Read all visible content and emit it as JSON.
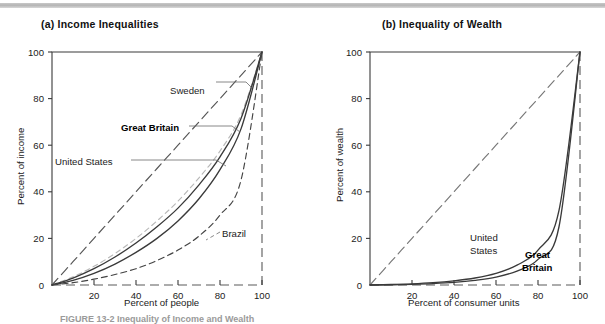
{
  "figure": {
    "top_rule_color": "#b9b9b9",
    "caption": "FIGURE 13-2   Inequality of Income and Wealth"
  },
  "panels": [
    {
      "key": "a",
      "title": "(a) Income Inequalities",
      "xlabel": "Percent of people",
      "ylabel": "Percent of income",
      "xticks": [
        "20",
        "40",
        "60",
        "80",
        "100"
      ],
      "yticks": [
        "0",
        "20",
        "40",
        "60",
        "80",
        "100"
      ],
      "labels": [
        {
          "text": "Sweden",
          "bold": false
        },
        {
          "text": "Great Britain",
          "bold": true
        },
        {
          "text": "United States",
          "bold": false
        },
        {
          "text": "Brazil",
          "bold": false
        }
      ]
    },
    {
      "key": "b",
      "title": "(b) Inequality of Wealth",
      "xlabel": "Percent of consumer units",
      "ylabel": "Percent of wealth",
      "xticks": [
        "20",
        "40",
        "60",
        "80",
        "100"
      ],
      "yticks": [
        "0",
        "20",
        "40",
        "60",
        "80",
        "100"
      ],
      "labels": [
        {
          "text": "United",
          "bold": false
        },
        {
          "text": "States",
          "bold": false
        },
        {
          "text": "Great",
          "bold": true
        },
        {
          "text": "Britain",
          "bold": true
        }
      ]
    }
  ],
  "chart_data": [
    {
      "type": "line",
      "title": "(a) Income Inequalities",
      "xlabel": "Percent of people",
      "ylabel": "Percent of income",
      "xlim": [
        0,
        100
      ],
      "ylim": [
        0,
        100
      ],
      "xticks": [
        20,
        40,
        60,
        80,
        100
      ],
      "yticks": [
        0,
        20,
        40,
        60,
        80,
        100
      ],
      "grid": false,
      "legend": "inline-annotations",
      "x": [
        0,
        10,
        20,
        30,
        40,
        50,
        60,
        70,
        80,
        90,
        100
      ],
      "series": [
        {
          "name": "Line of equality",
          "style": "long-dash",
          "color": "#555555",
          "values": [
            0,
            10,
            20,
            30,
            40,
            50,
            60,
            70,
            80,
            90,
            100
          ]
        },
        {
          "name": "Sweden",
          "style": "short-dash-light",
          "color": "#b8b8b8",
          "values": [
            0,
            3.5,
            8,
            13.5,
            20,
            27.5,
            36,
            46,
            57.5,
            73,
            100
          ]
        },
        {
          "name": "Great Britain",
          "style": "solid",
          "color": "#3a3a3a",
          "values": [
            0,
            3,
            7,
            12,
            18,
            25,
            33,
            43,
            55,
            71.5,
            100
          ]
        },
        {
          "name": "United States",
          "style": "solid",
          "color": "#3a3a3a",
          "values": [
            0,
            2,
            5,
            9,
            14,
            20,
            27.5,
            37,
            49.5,
            67,
            100
          ]
        },
        {
          "name": "Brazil",
          "style": "dash",
          "color": "#444444",
          "values": [
            0,
            1,
            2.5,
            4.5,
            7,
            10.5,
            15,
            21,
            30,
            45,
            100
          ]
        }
      ]
    },
    {
      "type": "line",
      "title": "(b) Inequality of Wealth",
      "xlabel": "Percent of consumer units",
      "ylabel": "Percent of wealth",
      "xlim": [
        0,
        100
      ],
      "ylim": [
        0,
        100
      ],
      "xticks": [
        20,
        40,
        60,
        80,
        100
      ],
      "yticks": [
        0,
        20,
        40,
        60,
        80,
        100
      ],
      "grid": false,
      "legend": "inline-annotations",
      "x": [
        0,
        10,
        20,
        30,
        40,
        50,
        60,
        70,
        80,
        90,
        100
      ],
      "series": [
        {
          "name": "Line of equality",
          "style": "long-dash",
          "color": "#777777",
          "values": [
            0,
            10,
            20,
            30,
            40,
            50,
            60,
            70,
            80,
            90,
            100
          ]
        },
        {
          "name": "United States",
          "style": "solid",
          "color": "#3a3a3a",
          "values": [
            0,
            0.2,
            0.5,
            1,
            1.8,
            3,
            5,
            8.5,
            15,
            32,
            100
          ]
        },
        {
          "name": "Great Britain",
          "style": "solid",
          "color": "#3a3a3a",
          "values": [
            0,
            0.1,
            0.3,
            0.6,
            1.1,
            2,
            3.4,
            6,
            11,
            25,
            100
          ]
        }
      ]
    }
  ]
}
